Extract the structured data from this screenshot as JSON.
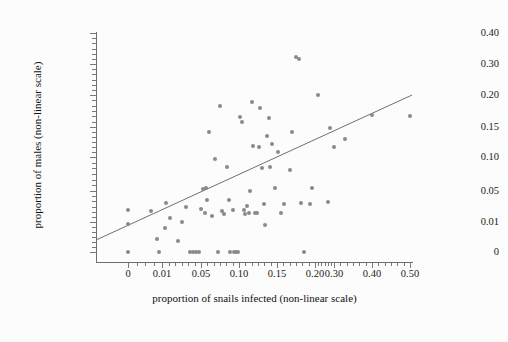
{
  "figure": {
    "background_color": "#fcfcfc",
    "point_color": "#8a8a8a",
    "line_color": "#707070",
    "axis_color": "#6e6e6e"
  },
  "axes": {
    "x_title": "proportion of snails infected (non-linear scale)",
    "y_title": "proportion of males (non-linear scale)",
    "x_ticks": [
      "0",
      "0.01",
      "0.05",
      "0.10",
      "0.15",
      "0.20",
      "0.30",
      "0.40",
      "0.50"
    ],
    "y_ticks": [
      "0",
      "0.01",
      "0.05",
      "0.10",
      "0.15",
      "0.20",
      "0.30",
      "0.40"
    ]
  },
  "chart_data": {
    "type": "scatter",
    "title": "",
    "xlabel": "proportion of snails infected (non-linear scale)",
    "ylabel": "proportion of males (non-linear scale)",
    "xscale": "non-linear",
    "yscale": "non-linear",
    "grid": false,
    "legend": null,
    "x_tick_values": [
      0,
      0.01,
      0.05,
      0.1,
      0.15,
      0.2,
      0.3,
      0.4,
      0.5
    ],
    "x_tick_labels": [
      "0",
      "0.01",
      "0.05",
      "0.10",
      "0.15",
      "0.20",
      "0.30",
      "0.40",
      "0.50"
    ],
    "x_tick_px": [
      128,
      162,
      201,
      239,
      277,
      315,
      334,
      372,
      410
    ],
    "y_tick_values": [
      0,
      0.01,
      0.05,
      0.1,
      0.15,
      0.2,
      0.3,
      0.4
    ],
    "y_tick_labels": [
      "0",
      "0.01",
      "0.05",
      "0.10",
      "0.15",
      "0.20",
      "0.30",
      "0.40"
    ],
    "y_tick_px": [
      252,
      222,
      191,
      157,
      127,
      95,
      64,
      33
    ],
    "xlim_px": [
      96,
      413
    ],
    "ylim_px": [
      262,
      32
    ],
    "series": [
      {
        "name": "observations",
        "marker": "circle",
        "color": "#8a8a8a",
        "points_px": [
          [
            128,
            210
          ],
          [
            128,
            224
          ],
          [
            128,
            252
          ],
          [
            151,
            211
          ],
          [
            157,
            239
          ],
          [
            159,
            252
          ],
          [
            165,
            228
          ],
          [
            166,
            203
          ],
          [
            170,
            218
          ],
          [
            178,
            241
          ],
          [
            182,
            222
          ],
          [
            186,
            207
          ],
          [
            190,
            252
          ],
          [
            193,
            252
          ],
          [
            196,
            252
          ],
          [
            199,
            252
          ],
          [
            201,
            209
          ],
          [
            203,
            189
          ],
          [
            205,
            213
          ],
          [
            206,
            188
          ],
          [
            207,
            200
          ],
          [
            209,
            132
          ],
          [
            212,
            216
          ],
          [
            215,
            159
          ],
          [
            218,
            252
          ],
          [
            220,
            106
          ],
          [
            222,
            211
          ],
          [
            224,
            214
          ],
          [
            227,
            167
          ],
          [
            229,
            200
          ],
          [
            230,
            252
          ],
          [
            233,
            210
          ],
          [
            234,
            252
          ],
          [
            236,
            252
          ],
          [
            238,
            252
          ],
          [
            240,
            117
          ],
          [
            242,
            122
          ],
          [
            244,
            210
          ],
          [
            245,
            214
          ],
          [
            247,
            206
          ],
          [
            249,
            213
          ],
          [
            250,
            191
          ],
          [
            252,
            102
          ],
          [
            253,
            146
          ],
          [
            255,
            213
          ],
          [
            257,
            213
          ],
          [
            259,
            147
          ],
          [
            260,
            108
          ],
          [
            262,
            168
          ],
          [
            264,
            204
          ],
          [
            265,
            225
          ],
          [
            267,
            136
          ],
          [
            269,
            118
          ],
          [
            270,
            167
          ],
          [
            272,
            144
          ],
          [
            275,
            188
          ],
          [
            278,
            152
          ],
          [
            281,
            213
          ],
          [
            284,
            204
          ],
          [
            290,
            170
          ],
          [
            292,
            132
          ],
          [
            296,
            57
          ],
          [
            299,
            59
          ],
          [
            301,
            203
          ],
          [
            304,
            252
          ],
          [
            310,
            204
          ],
          [
            312,
            188
          ],
          [
            318,
            95
          ],
          [
            328,
            202
          ],
          [
            330,
            128
          ],
          [
            334,
            147
          ],
          [
            345,
            139
          ],
          [
            372,
            115
          ],
          [
            410,
            116
          ]
        ]
      }
    ],
    "fit_line": {
      "name": "regression line",
      "color": "#707070",
      "x1_px": 96,
      "y1_px": 240,
      "x2_px": 412,
      "y2_px": 95
    }
  }
}
